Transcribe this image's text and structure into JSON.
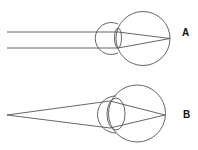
{
  "diagram": {
    "panels": [
      {
        "label": "A",
        "description": "Parallel rays from a distant object focused onto the retina by a flattened lens",
        "rays": "parallel"
      },
      {
        "label": "B",
        "description": "Diverging rays from a near point source focused onto the retina by a rounded lens",
        "rays": "diverging"
      }
    ],
    "colors": {
      "line": "#555555",
      "label": "#111111",
      "background": "#ffffff"
    }
  }
}
